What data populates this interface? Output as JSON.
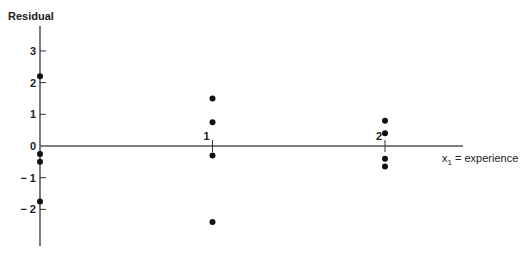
{
  "chart_data": {
    "type": "scatter",
    "title": "",
    "ylabel": "Residual",
    "xlabel": "x1 = experience",
    "xlabel_main": "x",
    "xlabel_sub": "1",
    "xlabel_rest": " = experience",
    "x_ticks": [
      "1",
      "2"
    ],
    "y_ticks": [
      "3",
      "2",
      "1",
      "0",
      "− 1",
      "− 2"
    ],
    "ylim": [
      -2.8,
      3.6
    ],
    "xlim": [
      0,
      2.8
    ],
    "grid": false,
    "points": [
      {
        "x": 0,
        "y": 2.2
      },
      {
        "x": 0,
        "y": -0.25
      },
      {
        "x": 0,
        "y": -0.5
      },
      {
        "x": 0,
        "y": -1.75
      },
      {
        "x": 1,
        "y": 1.5
      },
      {
        "x": 1,
        "y": 0.75
      },
      {
        "x": 1,
        "y": -0.3
      },
      {
        "x": 1,
        "y": -2.4
      },
      {
        "x": 2,
        "y": 0.8
      },
      {
        "x": 2,
        "y": 0.4
      },
      {
        "x": 2,
        "y": -0.4
      },
      {
        "x": 2,
        "y": -0.65
      }
    ]
  }
}
